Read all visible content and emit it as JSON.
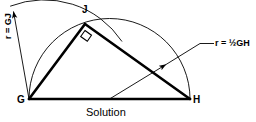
{
  "figure": {
    "caption": "Solution",
    "vertices": [
      {
        "id": "G",
        "label": "G",
        "x": 29,
        "y": 99
      },
      {
        "id": "J",
        "label": "J",
        "x": 85,
        "y": 24
      },
      {
        "id": "H",
        "label": "H",
        "x": 190,
        "y": 99
      }
    ],
    "annotations": [
      {
        "id": "radius-gj",
        "label": "r = GJ"
      },
      {
        "id": "radius-half-gh",
        "label": "r = ½GH"
      }
    ],
    "colors": {
      "stroke": "#000000",
      "background": "#ffffff",
      "text": "#000000"
    },
    "geometry": {
      "segment_gh": {
        "x1": 29,
        "y1": 99,
        "x2": 190,
        "y2": 99
      },
      "segment_gj": {
        "x1": 29,
        "y1": 99,
        "x2": 85,
        "y2": 24
      },
      "segment_jh": {
        "x1": 85,
        "y1": 24,
        "x2": 190,
        "y2": 99
      },
      "right_angle_at": "J",
      "semicircle": {
        "cx": 109.5,
        "cy": 99,
        "r": 80.5,
        "note": "diameter GH"
      },
      "arc_radius_gj": {
        "cx": 29,
        "cy": 99,
        "r": 93.6,
        "note": "centered at G, radius GJ"
      },
      "leader_gj": {
        "x1": 29,
        "y1": 99,
        "x2": 12,
        "y2": 8,
        "arrow_at": "end"
      },
      "leader_half_gh": {
        "x1": 109.5,
        "y1": 99,
        "x2": 168,
        "y2": 63,
        "arrow_at": "end"
      },
      "leader_half_gh_tail": {
        "x1": 168,
        "y1": 63,
        "x2": 200,
        "y2": 44,
        "elbow_x": 213,
        "elbow_y": 44
      }
    }
  }
}
